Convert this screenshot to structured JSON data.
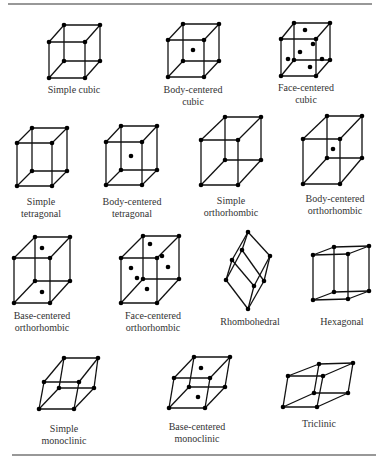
{
  "figure": {
    "lattices": [
      {
        "id": "simple-cubic",
        "label_lines": [
          "Simple cubic"
        ]
      },
      {
        "id": "body-centered-cubic",
        "label_lines": [
          "Body-centered",
          "cubic"
        ]
      },
      {
        "id": "face-centered-cubic",
        "label_lines": [
          "Face-centered",
          "cubic"
        ]
      },
      {
        "id": "simple-tetragonal",
        "label_lines": [
          "Simple",
          "tetragonal"
        ]
      },
      {
        "id": "body-centered-tetragonal",
        "label_lines": [
          "Body-centered",
          "tetragonal"
        ]
      },
      {
        "id": "simple-orthorhombic",
        "label_lines": [
          "Simple",
          "orthorhombic"
        ]
      },
      {
        "id": "body-centered-orthorhombic",
        "label_lines": [
          "Body-centered",
          "orthorhombic"
        ]
      },
      {
        "id": "base-centered-orthorhombic",
        "label_lines": [
          "Base-centered",
          "orthorhombic"
        ]
      },
      {
        "id": "face-centered-orthorhombic",
        "label_lines": [
          "Face-centered",
          "orthorhombic"
        ]
      },
      {
        "id": "rhombohedral",
        "label_lines": [
          "Rhombohedral"
        ]
      },
      {
        "id": "hexagonal",
        "label_lines": [
          "Hexagonal"
        ]
      },
      {
        "id": "simple-monoclinic",
        "label_lines": [
          "Simple",
          "monoclinic"
        ]
      },
      {
        "id": "base-centered-monoclinic",
        "label_lines": [
          "Base-centered",
          "monoclinic"
        ]
      },
      {
        "id": "triclinic",
        "label_lines": [
          "Triclinic"
        ]
      }
    ]
  }
}
